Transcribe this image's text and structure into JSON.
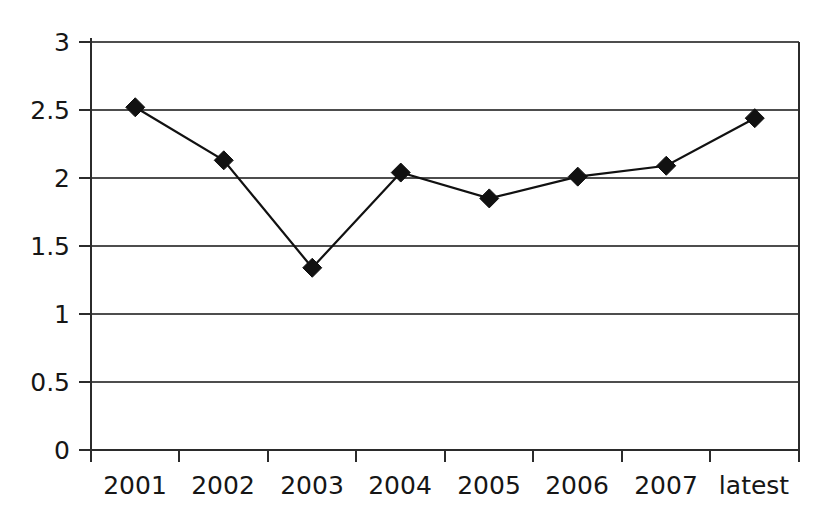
{
  "chart_data": {
    "type": "line",
    "title": "",
    "subtitle": "",
    "xlabel": "",
    "ylabel": "",
    "categories": [
      "2001",
      "2002",
      "2003",
      "2004",
      "2005",
      "2006",
      "2007",
      "latest"
    ],
    "series": [
      {
        "name": "series-1",
        "values": [
          2.52,
          2.13,
          1.34,
          2.04,
          1.85,
          2.01,
          2.09,
          2.44
        ],
        "marker": "diamond",
        "marker_color": "#111111",
        "line_color": "#111111"
      }
    ],
    "ylim": [
      0,
      3
    ],
    "y_ticks": [
      0,
      0.5,
      1,
      1.5,
      2,
      2.5,
      3
    ],
    "y_tick_labels": [
      "0",
      "0.5",
      "1",
      "1.5",
      "2",
      "2.5",
      "3"
    ],
    "grid": {
      "horizontal": true,
      "vertical": false,
      "color": "#4d4d4d"
    },
    "legend": {
      "visible": false,
      "position": "none",
      "entries": []
    },
    "annotations": [],
    "axes": {
      "x_axis_line": true,
      "y_axis_line": true,
      "x_tick_marks": true,
      "y_tick_marks": true,
      "axis_color": "#2b2b2b"
    },
    "plot_background": "#ffffff",
    "figure_background": "#ffffff"
  }
}
